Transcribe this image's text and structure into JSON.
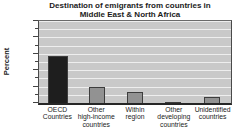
{
  "title": {
    "line1": "Destination of emigrants from countries in",
    "line2": "Middle East & North Africa"
  },
  "chart_data": {
    "type": "bar",
    "title": "Destination of emigrants from countries in Middle East & North Africa",
    "xlabel": "",
    "ylabel": "Percent",
    "ylim": [
      0,
      100
    ],
    "yticks": [
      0,
      20,
      40,
      60,
      80,
      100
    ],
    "minor_tick_step": 10,
    "grid": "horizontal, every 10 units",
    "legend": "none",
    "categories": [
      "OECD Countries",
      "Other high-income countries",
      "Within region",
      "Other developing countries",
      "Unidentified countries"
    ],
    "category_label_lines": [
      [
        "OECD",
        "Countries"
      ],
      [
        "Other",
        "high-income",
        "countries"
      ],
      [
        "Within",
        "region"
      ],
      [
        "Other",
        "developing",
        "countries"
      ],
      [
        "Unidentified",
        "countries"
      ]
    ],
    "values": [
      57,
      20,
      14,
      1.5,
      7
    ],
    "bar_colors": [
      "#1e1e1e",
      "#929292",
      "#929292",
      "#929292",
      "#929292"
    ],
    "bar_widths_px": [
      20,
      16,
      16,
      16,
      16
    ],
    "bar_border_color": "#3d3d3d",
    "plot_bg": "#c9c9c9",
    "gridline_color": "#eeeeee"
  }
}
